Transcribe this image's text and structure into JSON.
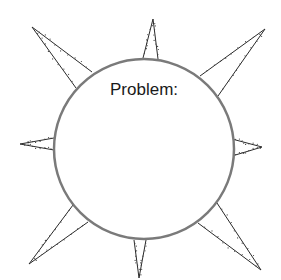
{
  "diagram": {
    "type": "sun-diagram",
    "center_label": "Problem:",
    "colors": {
      "circle_stroke": "#7a7a7a",
      "ray_stroke": "#2a2a2a",
      "text": "#1a1a1a",
      "background": "#ffffff"
    },
    "circle": {
      "cx": 144,
      "cy": 149,
      "r": 90
    },
    "rays": [
      {
        "name": "ray-top-left",
        "tip": [
          32,
          27
        ],
        "base": [
          [
            92,
            72
          ],
          [
            76,
            88
          ]
        ]
      },
      {
        "name": "ray-top",
        "tip": [
          153,
          19
        ],
        "base": [
          [
            143,
            58
          ],
          [
            158,
            59
          ]
        ]
      },
      {
        "name": "ray-top-right",
        "tip": [
          265,
          29
        ],
        "base": [
          [
            200,
            76
          ],
          [
            218,
            96
          ]
        ]
      },
      {
        "name": "ray-right",
        "tip": [
          262,
          147
        ],
        "base": [
          [
            232,
            139
          ],
          [
            232,
            156
          ]
        ]
      },
      {
        "name": "ray-bottom-right",
        "tip": [
          261,
          270
        ],
        "base": [
          [
            217,
            203
          ],
          [
            198,
            223
          ]
        ]
      },
      {
        "name": "ray-bottom",
        "tip": [
          139,
          278
        ],
        "base": [
          [
            134,
            240
          ],
          [
            146,
            240
          ]
        ]
      },
      {
        "name": "ray-bottom-left",
        "tip": [
          29,
          264
        ],
        "base": [
          [
            73,
            205
          ],
          [
            88,
            222
          ]
        ]
      },
      {
        "name": "ray-left",
        "tip": [
          20,
          144
        ],
        "base": [
          [
            54,
            138
          ],
          [
            54,
            150
          ]
        ]
      }
    ]
  }
}
